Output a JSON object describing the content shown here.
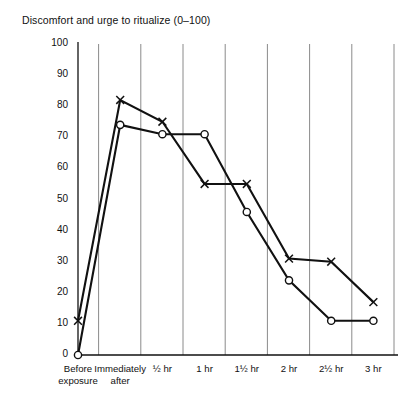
{
  "chart": {
    "title": "Discomfort and urge to ritualize (0–100)",
    "yticks": [
      "100",
      "90",
      "80",
      "70",
      "60",
      "50",
      "40",
      "30",
      "20",
      "10",
      "0"
    ],
    "xticks": [
      {
        "line1": "Before",
        "line2": "exposure"
      },
      {
        "line1": "Immediately",
        "line2": "after"
      },
      {
        "line1": "½ hr",
        "line2": ""
      },
      {
        "line1": "1 hr",
        "line2": ""
      },
      {
        "line1": "1½ hr",
        "line2": ""
      },
      {
        "line1": "2 hr",
        "line2": ""
      },
      {
        "line1": "2½ hr",
        "line2": ""
      },
      {
        "line1": "3 hr",
        "line2": ""
      }
    ],
    "series_names": [
      "Discomfort (x)",
      "Urge to ritualize (o)"
    ],
    "marker_x": "x-marker",
    "marker_o": "circle-marker",
    "line_color": "#111111",
    "grid_color": "#8a8a8a",
    "axis_color": "#111111"
  },
  "chart_data": {
    "type": "line",
    "title": "Discomfort and urge to ritualize (0–100)",
    "xlabel": "",
    "ylabel": "",
    "ylim": [
      0,
      100
    ],
    "ytick_values": [
      0,
      10,
      20,
      30,
      40,
      50,
      60,
      70,
      80,
      90,
      100
    ],
    "grid": true,
    "grid_axis": "x",
    "legend": "none",
    "categories": [
      "Before exposure",
      "Immediately after",
      "½ hr",
      "1 hr",
      "1½ hr",
      "2 hr",
      "2½ hr",
      "3 hr"
    ],
    "series": [
      {
        "name": "Discomfort (x)",
        "marker": "x",
        "values": [
          11,
          82,
          75,
          55,
          55,
          31,
          30,
          17
        ]
      },
      {
        "name": "Urge to ritualize (o)",
        "marker": "o",
        "values": [
          0,
          74,
          71,
          71,
          46,
          24,
          11,
          11
        ]
      }
    ]
  }
}
